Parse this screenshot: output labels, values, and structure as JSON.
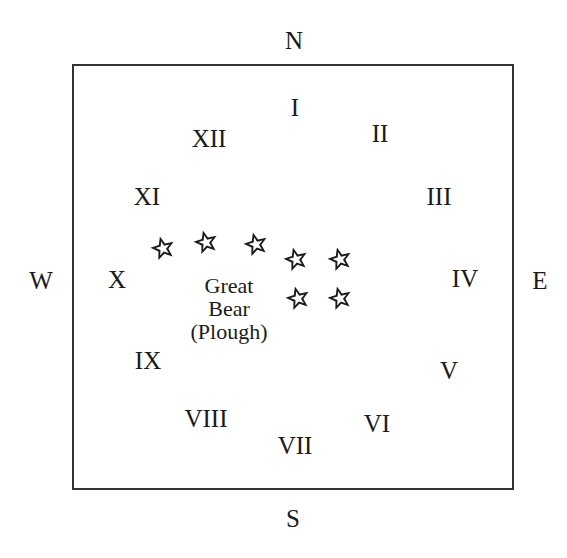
{
  "compass": {
    "north": "N",
    "south": "S",
    "east": "E",
    "west": "W"
  },
  "hours": [
    {
      "label": "I",
      "x": 295,
      "y": 107
    },
    {
      "label": "II",
      "x": 380,
      "y": 133
    },
    {
      "label": "III",
      "x": 439,
      "y": 196
    },
    {
      "label": "IV",
      "x": 465,
      "y": 278
    },
    {
      "label": "V",
      "x": 449,
      "y": 370
    },
    {
      "label": "VI",
      "x": 377,
      "y": 423
    },
    {
      "label": "VII",
      "x": 295,
      "y": 445
    },
    {
      "label": "VIII",
      "x": 206,
      "y": 418
    },
    {
      "label": "IX",
      "x": 148,
      "y": 360
    },
    {
      "label": "X",
      "x": 117,
      "y": 279
    },
    {
      "label": "XI",
      "x": 147,
      "y": 196
    },
    {
      "label": "XII",
      "x": 209,
      "y": 138
    }
  ],
  "constellation": {
    "lines": [
      "Great",
      "Bear",
      "(Plough)"
    ],
    "stars": [
      {
        "x": 163,
        "y": 248
      },
      {
        "x": 206,
        "y": 242
      },
      {
        "x": 256,
        "y": 244
      },
      {
        "x": 296,
        "y": 259
      },
      {
        "x": 340,
        "y": 259
      },
      {
        "x": 298,
        "y": 298
      },
      {
        "x": 340,
        "y": 298
      }
    ]
  },
  "colors": {
    "stroke": "#1a1a1a",
    "frame": "#333333",
    "background": "#ffffff"
  }
}
